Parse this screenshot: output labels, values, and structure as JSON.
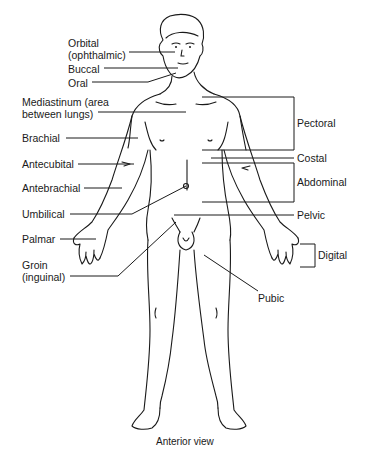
{
  "figure": {
    "caption": "Anterior view",
    "labels_left": [
      {
        "id": "orbital",
        "text": "Orbital\n(ophthalmic)",
        "line1": "Orbital",
        "line2": "(ophthalmic)"
      },
      {
        "id": "buccal",
        "text": "Buccal"
      },
      {
        "id": "oral",
        "text": "Oral"
      },
      {
        "id": "mediastinum",
        "line1": "Mediastinum (area",
        "line2": "between lungs)"
      },
      {
        "id": "brachial",
        "text": "Brachial"
      },
      {
        "id": "antecubital",
        "text": "Antecubital"
      },
      {
        "id": "antebrachial",
        "text": "Antebrachial"
      },
      {
        "id": "umbilical",
        "text": "Umbilical"
      },
      {
        "id": "palmar",
        "text": "Palmar"
      },
      {
        "id": "groin",
        "line1": "Groin",
        "line2": "(inguinal)"
      }
    ],
    "labels_right": [
      {
        "id": "pectoral",
        "text": "Pectoral"
      },
      {
        "id": "costal",
        "text": "Costal"
      },
      {
        "id": "abdominal",
        "text": "Abdominal"
      },
      {
        "id": "pelvic",
        "text": "Pelvic"
      },
      {
        "id": "digital",
        "text": "Digital"
      },
      {
        "id": "pubic",
        "text": "Pubic"
      }
    ]
  }
}
